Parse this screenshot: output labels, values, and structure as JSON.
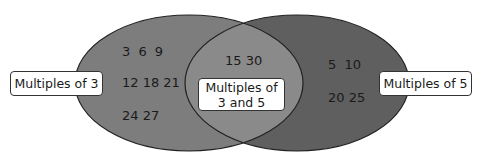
{
  "diagram": {
    "type": "venn",
    "left_set": {
      "label": "Multiples of 3",
      "rows": [
        "3  6  9",
        "12 18 21",
        "24 27"
      ],
      "color": "#7d7d7d"
    },
    "right_set": {
      "label": "Multiples of 5",
      "rows": [
        "5   10",
        "20 25"
      ],
      "color": "#5f5f5f"
    },
    "intersection": {
      "label_line1": "Multiples of",
      "label_line2": "3 and 5",
      "rows": [
        "15 30"
      ],
      "color": "#8a8a8a"
    }
  }
}
